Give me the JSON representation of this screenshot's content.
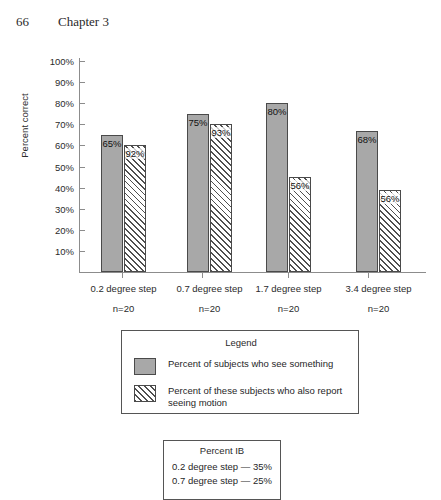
{
  "page": {
    "folio": "66",
    "chapter": "Chapter 3"
  },
  "chart_data": {
    "type": "bar",
    "title": "",
    "xlabel": "",
    "ylabel": "Percent correct",
    "ylim": [
      0,
      100
    ],
    "ytick_labels": [
      "100%",
      "90%",
      "80%",
      "70%",
      "60%",
      "50%",
      "40%",
      "30%",
      "20%",
      "10%"
    ],
    "ytick_values": [
      100,
      90,
      80,
      70,
      60,
      50,
      40,
      30,
      20,
      10
    ],
    "grid": false,
    "legend_position": "below-plot",
    "categories": [
      "0.2 degree step",
      "0.7 degree step",
      "1.7 degree step",
      "3.4 degree step"
    ],
    "category_sublabels": [
      "n=20",
      "n=20",
      "n=20",
      "n=20"
    ],
    "series": [
      {
        "name": "Percent of subjects who see something",
        "fill": "solid",
        "color": "#a8a8a8",
        "values": [
          65,
          75,
          80,
          68
        ],
        "labels": [
          "65%",
          "75%",
          "80%",
          "68%"
        ],
        "drawn_heights": [
          65,
          75,
          80,
          67
        ]
      },
      {
        "name": "Percent of these subjects who also report seeing motion",
        "fill": "hatched",
        "color": "#f7f7f7",
        "values": [
          92,
          93,
          56,
          56
        ],
        "labels": [
          "92%",
          "93%",
          "56%",
          "56%"
        ],
        "drawn_heights": [
          60,
          70,
          45,
          39
        ]
      }
    ]
  },
  "legend": {
    "title": "Legend",
    "items": [
      {
        "swatch": "solid",
        "label": "Percent of subjects who see something"
      },
      {
        "swatch": "hatched",
        "label": "Percent of these subjects who also report seeing motion"
      }
    ]
  },
  "percent_ib": {
    "title": "Percent IB",
    "rows": [
      "0.2 degree step — 35%",
      "0.7 degree step — 25%"
    ]
  }
}
